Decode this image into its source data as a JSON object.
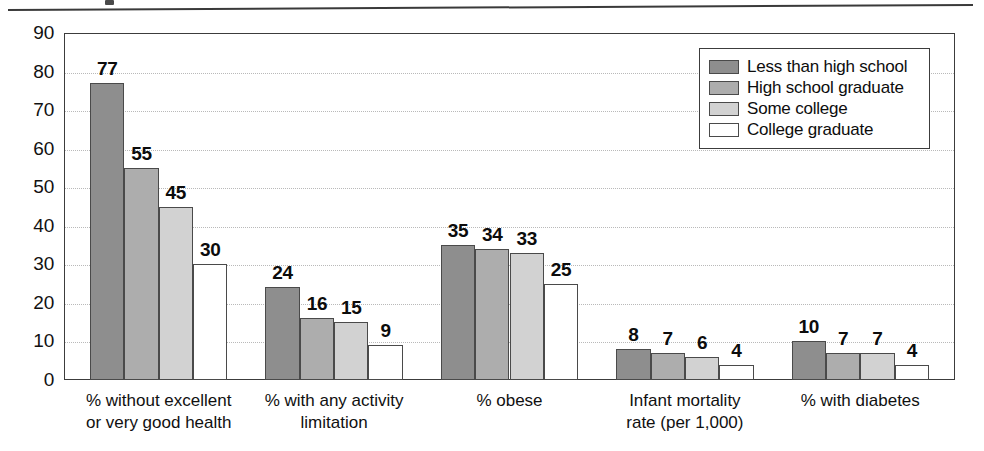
{
  "chart_data": {
    "type": "bar",
    "title": "",
    "xlabel": "",
    "ylabel": "Percent",
    "ylim": [
      0,
      90
    ],
    "ytick_values": [
      0,
      10,
      20,
      30,
      40,
      50,
      60,
      70,
      80,
      90
    ],
    "ytick_labels": [
      "0",
      "10",
      "20",
      "30",
      "40",
      "50",
      "60",
      "70",
      "80",
      "90"
    ],
    "grid": true,
    "grid_axis": "y",
    "legend_position": "upper right",
    "categories": [
      "% without excellent\nor very good health",
      "% with any activity\nlimitation",
      "% obese",
      "Infant mortality\nrate (per 1,000)",
      "% with diabetes"
    ],
    "series": [
      {
        "name": "Less than high school",
        "color": "#8e8e8e",
        "values": [
          77,
          24,
          35,
          8,
          10
        ]
      },
      {
        "name": "High school graduate",
        "color": "#adadad",
        "values": [
          55,
          16,
          34,
          7,
          7
        ]
      },
      {
        "name": "Some college",
        "color": "#d2d2d2",
        "values": [
          45,
          15,
          33,
          6,
          7
        ]
      },
      {
        "name": "College graduate",
        "color": "#ffffff",
        "values": [
          30,
          9,
          25,
          4,
          4
        ]
      }
    ]
  },
  "legend": {
    "entries": [
      "Less than high school",
      "High school graduate",
      "Some college",
      "College graduate"
    ]
  },
  "axis": {
    "y_title": "Percent"
  }
}
